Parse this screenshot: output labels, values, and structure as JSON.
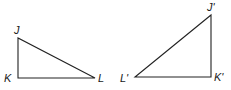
{
  "figure": {
    "stroke_color": "#222222",
    "background": "#ffffff",
    "triangles": [
      {
        "name": "JKL",
        "vertices": [
          {
            "label": "J",
            "x": 18,
            "y": 38
          },
          {
            "label": "K",
            "x": 18,
            "y": 78
          },
          {
            "label": "L",
            "x": 95,
            "y": 78
          }
        ]
      },
      {
        "name": "J'K'L'",
        "vertices": [
          {
            "label": "J'",
            "x": 211,
            "y": 15
          },
          {
            "label": "K'",
            "x": 211,
            "y": 77
          },
          {
            "label": "L'",
            "x": 135,
            "y": 77
          }
        ]
      }
    ]
  }
}
